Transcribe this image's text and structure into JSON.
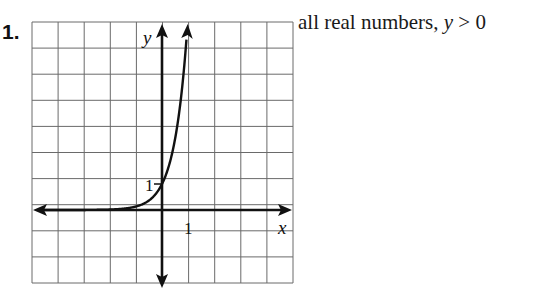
{
  "problem": {
    "number": "1.",
    "answer_prefix": "all real numbers, ",
    "answer_var": "y",
    "answer_suffix": " > 0"
  },
  "graph": {
    "x_axis_label": "x",
    "y_axis_label": "y",
    "x_tick_label": "1",
    "y_tick_label": "1"
  },
  "chart_data": {
    "type": "line",
    "title": "",
    "function": "y = e^(2x) (exponential growth through (0,1))",
    "xlabel": "x",
    "ylabel": "y",
    "xlim": [
      -5,
      5
    ],
    "ylim": [
      -3,
      7
    ],
    "grid": true,
    "grid_step": 1,
    "x_ticks_labeled": [
      1
    ],
    "y_ticks_labeled": [
      1
    ],
    "series": [
      {
        "name": "curve",
        "x": [
          -5,
          -3,
          -2,
          -1,
          -0.5,
          0,
          0.25,
          0.5,
          0.75,
          0.97
        ],
        "y": [
          0.0,
          0.0025,
          0.018,
          0.135,
          0.37,
          1.0,
          1.65,
          2.72,
          4.48,
          6.96
        ]
      }
    ],
    "annotations": [
      "y-intercept labeled 1",
      "asymptote y = 0"
    ]
  }
}
